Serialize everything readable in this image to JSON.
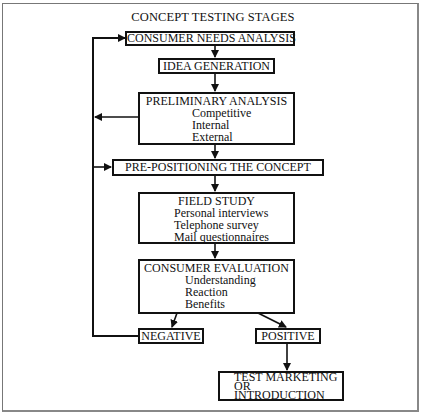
{
  "title": "CONCEPT TESTING STAGES",
  "stages": {
    "consumer_needs": {
      "label": "CONSUMER NEEDS ANALYSIS"
    },
    "idea_generation": {
      "label": "IDEA GENERATION"
    },
    "preliminary_analysis": {
      "label": "PRELIMINARY ANALYSIS",
      "items": [
        "Competitive",
        "Internal",
        "External"
      ]
    },
    "pre_positioning": {
      "label": "PRE-POSITIONING THE CONCEPT"
    },
    "field_study": {
      "label": "FIELD STUDY",
      "items": [
        "Personal interviews",
        "Telephone survey",
        "Mail questionnaires"
      ]
    },
    "consumer_evaluation": {
      "label": "CONSUMER EVALUATION",
      "items": [
        "Understanding",
        "Reaction",
        "Benefits"
      ]
    },
    "negative": {
      "label": "NEGATIVE"
    },
    "positive": {
      "label": "POSITIVE"
    },
    "test_marketing": {
      "lines": [
        "TEST MARKETING",
        "OR",
        "INTRODUCTION"
      ]
    }
  },
  "colors": {
    "line": "#111111",
    "background": "#ffffff",
    "frame": "#777777"
  }
}
